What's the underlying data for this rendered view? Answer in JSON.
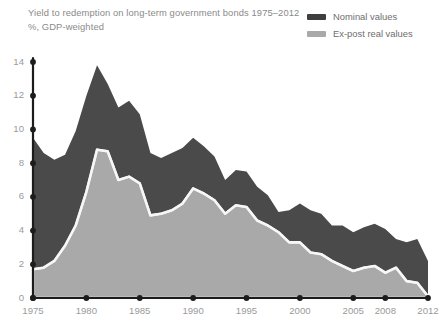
{
  "header": {
    "title_line1": "Yield to redemption on long-term government bonds 1975–2012",
    "title_line2": "%, GDP-weighted"
  },
  "legend": {
    "position": "top-right",
    "items": [
      {
        "label": "Nominal values",
        "color": "#3f3f3f",
        "icon": "legend-swatch-icon"
      },
      {
        "label": "Ex-post real values",
        "color": "#a9a9a9",
        "icon": "legend-swatch-icon"
      }
    ]
  },
  "axes": {
    "y_ticks": [
      "14",
      "12",
      "10",
      "8",
      "6",
      "4",
      "2",
      "0"
    ],
    "x_ticks": [
      "1975",
      "1980",
      "1985",
      "1990",
      "1995",
      "2000",
      "2005",
      "2008",
      "2012"
    ]
  },
  "colors": {
    "nominal": "#4a4a4a",
    "real": "#a9a9a9",
    "separator": "#f2f2f2",
    "axis": "#1c1c1c",
    "text": "#8f8f8f"
  },
  "chart_data": {
    "type": "area",
    "title": "Yield to redemption on long-term government bonds 1975–2012",
    "subtitle": "%, GDP-weighted",
    "xlabel": "",
    "ylabel": "%",
    "ylim": [
      0,
      14
    ],
    "xlim": [
      1975,
      2012
    ],
    "grid": false,
    "legend_position": "top-right",
    "x": [
      1975,
      1976,
      1977,
      1978,
      1979,
      1980,
      1981,
      1982,
      1983,
      1984,
      1985,
      1986,
      1987,
      1988,
      1989,
      1990,
      1991,
      1992,
      1993,
      1994,
      1995,
      1996,
      1997,
      1998,
      1999,
      2000,
      2001,
      2002,
      2003,
      2004,
      2005,
      2006,
      2007,
      2008,
      2009,
      2010,
      2011,
      2012
    ],
    "series": [
      {
        "name": "Nominal values",
        "color": "#4a4a4a",
        "values": [
          9.5,
          8.6,
          8.2,
          8.5,
          9.9,
          12.0,
          13.8,
          12.7,
          11.3,
          11.7,
          10.9,
          8.6,
          8.3,
          8.6,
          8.9,
          9.5,
          9.0,
          8.4,
          7.0,
          7.6,
          7.5,
          6.6,
          6.1,
          5.1,
          5.2,
          5.6,
          5.2,
          5.0,
          4.3,
          4.3,
          3.9,
          4.2,
          4.4,
          4.1,
          3.5,
          3.3,
          3.5,
          2.2
        ]
      },
      {
        "name": "Ex-post real values",
        "color": "#a9a9a9",
        "values": [
          1.7,
          1.8,
          2.2,
          3.1,
          4.3,
          6.3,
          8.8,
          8.7,
          7.0,
          7.2,
          6.8,
          4.9,
          5.0,
          5.2,
          5.6,
          6.5,
          6.2,
          5.8,
          5.0,
          5.5,
          5.4,
          4.6,
          4.3,
          3.9,
          3.3,
          3.3,
          2.7,
          2.6,
          2.2,
          1.9,
          1.6,
          1.8,
          1.9,
          1.5,
          1.8,
          1.0,
          0.9,
          0.1
        ]
      }
    ]
  }
}
